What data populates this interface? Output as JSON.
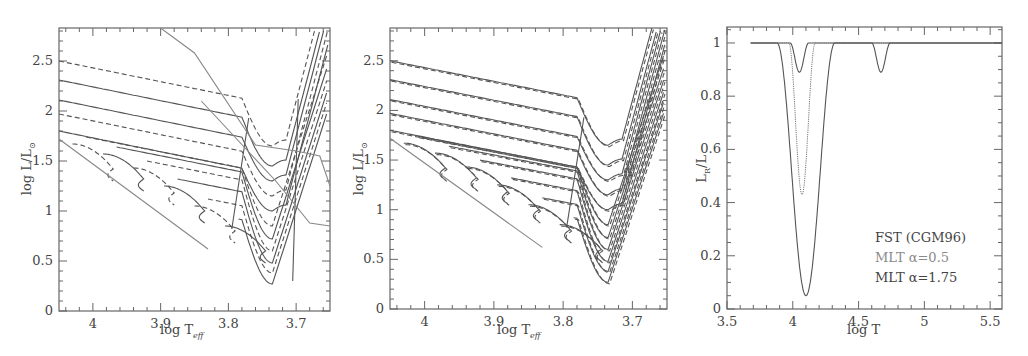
{
  "figure": {
    "panels": 3
  },
  "chart_data": [
    {
      "type": "line",
      "panel": "left",
      "title": "",
      "xlabel": "log T_eff",
      "ylabel": "log L/L_sun",
      "xlim": [
        4.05,
        3.65
      ],
      "ylim": [
        0,
        2.83
      ],
      "xticks": [
        "4",
        "3.9",
        "3.8",
        "3.7"
      ],
      "xtick_values": [
        4.0,
        3.9,
        3.8,
        3.7
      ],
      "yticks": [
        "0",
        "0.5",
        "1",
        "1.5",
        "2",
        "2.5"
      ],
      "ytick_values": [
        0,
        0.5,
        1,
        1.5,
        2,
        2.5
      ],
      "grid": false,
      "legend": null,
      "description": "Evolutionary tracks in HR diagram; solid and dashed alternating tracks with Hertzsprung gap and RGB; grey boundary lines",
      "tracks_start_logL": [
        2.5,
        2.31,
        2.11,
        1.97,
        1.8,
        1.72,
        1.62,
        1.48,
        1.3,
        1.1,
        0.9
      ],
      "tracks_style": [
        "dashed",
        "solid",
        "solid",
        "dashed",
        "solid",
        "dashed",
        "solid",
        "dashed",
        "solid",
        "dashed",
        "solid"
      ],
      "rgb_base_logL": [
        1.95,
        1.78,
        1.6,
        1.43,
        1.28,
        1.12,
        0.98,
        0.85,
        0.72,
        0.55,
        0.45,
        0.3
      ],
      "rgb_min_logT": 3.72,
      "blue_edge_line": [
        [
          3.795,
          0.82
        ],
        [
          3.77,
          1.93
        ]
      ],
      "red_edge_line": [
        [
          3.705,
          0.3
        ],
        [
          3.697,
          2.12
        ]
      ],
      "grey_line_upper": [
        [
          3.9,
          2.83
        ],
        [
          3.85,
          2.58
        ],
        [
          3.76,
          1.66
        ],
        [
          3.7,
          1.6
        ],
        [
          3.665,
          1.55
        ],
        [
          3.65,
          1.25
        ]
      ],
      "grey_line_lower": [
        [
          3.84,
          2.1
        ],
        [
          3.73,
          1.3
        ],
        [
          3.68,
          0.88
        ],
        [
          3.65,
          0.85
        ]
      ]
    },
    {
      "type": "line",
      "panel": "middle",
      "title": "",
      "xlabel": "log T_eff",
      "ylabel": "log L/L_sun",
      "xlim": [
        4.05,
        3.65
      ],
      "ylim": [
        0,
        2.83
      ],
      "xticks": [
        "4",
        "3.9",
        "3.8",
        "3.7"
      ],
      "xtick_values": [
        4.0,
        3.9,
        3.8,
        3.7
      ],
      "yticks": [
        "0",
        "0.5",
        "1",
        "1.5",
        "2",
        "2.5"
      ],
      "ytick_values": [
        0,
        0.5,
        1,
        1.5,
        2,
        2.5
      ],
      "grid": false,
      "legend": null,
      "description": "Same set of tracks, solid (one convection model) overlaid with dashed (other model), nearly coincident",
      "tracks_start_logL": [
        2.5,
        2.31,
        2.11,
        1.97,
        1.8,
        1.72,
        1.62,
        1.48,
        1.3,
        1.1,
        0.9
      ],
      "rgb_min_logL": [
        1.65,
        1.45,
        1.3,
        1.15,
        1.0,
        0.85,
        0.72,
        0.6,
        0.48,
        0.38,
        0.27
      ],
      "blue_edge_line": [
        [
          3.795,
          0.82
        ],
        [
          3.77,
          1.93
        ]
      ]
    },
    {
      "type": "line",
      "panel": "right",
      "title": "",
      "xlabel": "log T",
      "ylabel": "L_R/L",
      "xlim": [
        3.5,
        5.59
      ],
      "ylim": [
        0,
        1.06
      ],
      "xticks": [
        "3.5",
        "4",
        "4.5",
        "5",
        "5.5"
      ],
      "xtick_values": [
        3.5,
        4.0,
        4.5,
        5.0,
        5.5
      ],
      "yticks": [
        "0",
        "0.2",
        "0.4",
        "0.6",
        "0.8",
        "1"
      ],
      "ytick_values": [
        0,
        0.2,
        0.4,
        0.6,
        0.8,
        1.0
      ],
      "grid": false,
      "legend_position": "lower right",
      "series": [
        {
          "name": "FST (CGM96)",
          "x_start": 3.68,
          "dips": [
            {
              "center": 4.05,
              "min": 0.89,
              "halfwidth": 0.07
            },
            {
              "center": 4.67,
              "min": 0.89,
              "halfwidth": 0.07
            }
          ],
          "color": "#444444",
          "style": "solid"
        },
        {
          "name": "MLT α=0.5",
          "x_start": 3.68,
          "dips": [
            {
              "center": 4.07,
              "min": 0.43,
              "halfwidth": 0.1
            }
          ],
          "color": "#888888",
          "style": "dotted"
        },
        {
          "name": "MLT α=1.75",
          "x_start": 3.68,
          "dips": [
            {
              "center": 4.1,
              "min": 0.05,
              "halfwidth": 0.22
            }
          ],
          "color": "#555555",
          "style": "solid"
        }
      ]
    }
  ],
  "panels": {
    "left": {
      "xlabel_main": "log T",
      "xlabel_sub": "eff",
      "ylabel_main": "log L/L",
      "ylabel_sub": "⊙"
    },
    "middle": {
      "xlabel_main": "log T",
      "xlabel_sub": "eff",
      "ylabel_main": "log L/L",
      "ylabel_sub": "⊙"
    },
    "right": {
      "xlabel_main": "log T",
      "ylabel_main": "L",
      "ylabel_sub": "R",
      "ylabel_tail": "/L"
    }
  },
  "legend": {
    "items": [
      {
        "label": "FST (CGM96)",
        "color": "#444444"
      },
      {
        "label": "MLT α=0.5",
        "color": "#8a8a8a"
      },
      {
        "label": "MLT α=1.75",
        "color": "#444444"
      }
    ]
  }
}
